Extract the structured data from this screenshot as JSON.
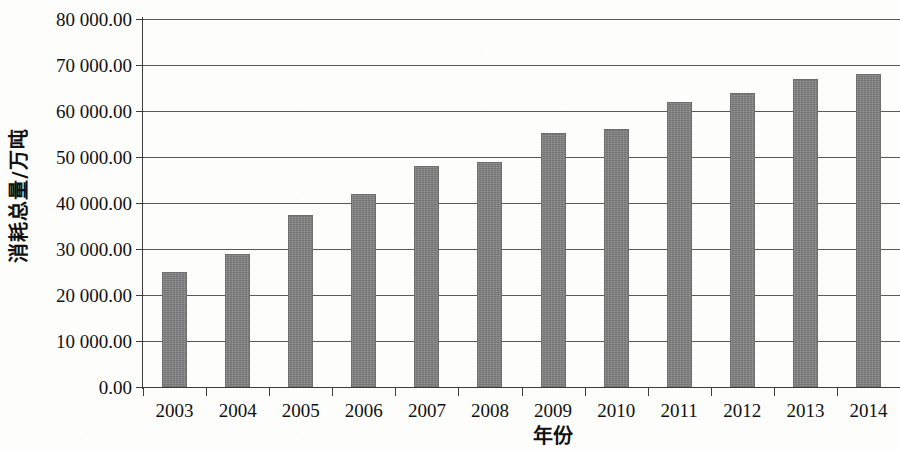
{
  "chart_data": {
    "type": "bar",
    "title": "",
    "xlabel": "年份",
    "ylabel": "消耗总量/万吨",
    "categories": [
      "2003",
      "2004",
      "2005",
      "2006",
      "2007",
      "2008",
      "2009",
      "2010",
      "2011",
      "2012",
      "2013",
      "2014"
    ],
    "values": [
      25000,
      29000,
      37500,
      42000,
      48000,
      49000,
      55200,
      56000,
      62000,
      64000,
      67000,
      68000
    ],
    "series": [
      {
        "name": "消耗总量",
        "values": [
          25000,
          29000,
          37500,
          42000,
          48000,
          49000,
          55200,
          56000,
          62000,
          64000,
          67000,
          68000
        ]
      }
    ],
    "ylim": [
      0,
      80000
    ],
    "ytick_values": [
      0,
      10000,
      20000,
      30000,
      40000,
      50000,
      60000,
      70000,
      80000
    ],
    "ytick_labels": [
      "0.00",
      "10 000.00",
      "20 000.00",
      "30 000.00",
      "40 000.00",
      "50 000.00",
      "60 000.00",
      "70 000.00",
      "80 000.00"
    ],
    "grid": true,
    "legend": false,
    "legend_position": "none",
    "bar_color": "#7f7f7f",
    "axis_color": "#3d3d3d",
    "gridline_color": "#5a5a5a",
    "background_color": "#fdfdfc"
  }
}
